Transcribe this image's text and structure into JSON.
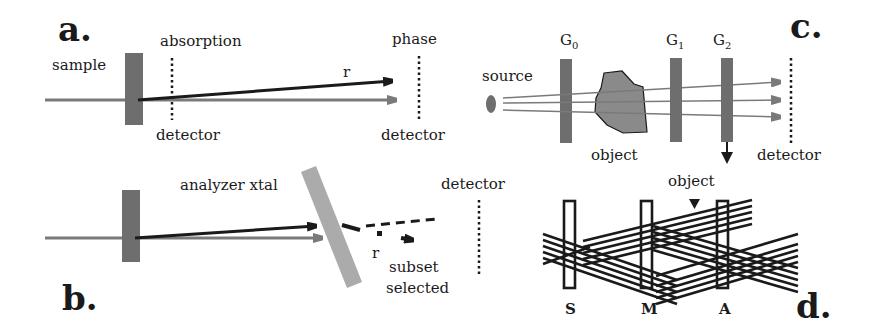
{
  "figure": {
    "panels": {
      "a": {
        "letter": "a.",
        "labels": {
          "sample": "sample",
          "absorption_detector_top": "absorption",
          "absorption_detector_bottom": "detector",
          "phase_detector_top": "phase",
          "phase_detector_bottom": "detector",
          "refraction": "r"
        }
      },
      "b": {
        "letter": "b.",
        "labels": {
          "analyzer": "analyzer  xtal",
          "detector": "detector",
          "refraction": "r",
          "subset_line1": "subset",
          "subset_line2": "selected"
        }
      },
      "c": {
        "letter": "c.",
        "labels": {
          "source": "source",
          "g0": "G",
          "g0_sub": "0",
          "g1": "G",
          "g1_sub": "1",
          "g2": "G",
          "g2_sub": "2",
          "object": "object",
          "detector": "detector"
        }
      },
      "d": {
        "letter": "d.",
        "labels": {
          "object": "object",
          "s": "S",
          "m": "M",
          "a": "A"
        }
      }
    },
    "colors": {
      "ink": "#1a1a1a",
      "sample_gray": "#6e6e6e",
      "beam_gray": "#7a7a7a",
      "crystal_gray": "#ababab",
      "object_gray": "#8a8a8a"
    }
  }
}
